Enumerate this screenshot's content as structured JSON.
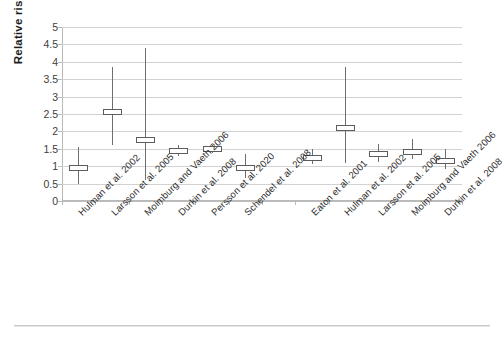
{
  "chart_data": {
    "type": "scatter",
    "title": "",
    "xlabel": "",
    "ylabel": "Relative risk",
    "ylim": [
      0,
      5
    ],
    "ytick_labels": [
      "5",
      "4.5",
      "4",
      "3.5",
      "3",
      "2.5",
      "2",
      "1.5",
      "1",
      "0.5",
      "0"
    ],
    "ytick_values": [
      5,
      4.5,
      4,
      3.5,
      3,
      2.5,
      2,
      1.5,
      1,
      0.5,
      0
    ],
    "grid": true,
    "legend": "none",
    "categories": [
      "Hulman et al. 2002",
      "Larsson et al. 2005",
      "Moimburg and Vaeth 2006",
      "Durkin et al. 2008",
      "Persson et al. 2020",
      "Schendel et al. 2008",
      "",
      "Eaton et al. 2001",
      "Hulman et al. 2002",
      "Larsson et al. 2005",
      "Moimburg and Vaeth 2006",
      "Durkin et al. 2008"
    ],
    "series": [
      {
        "name": "Relative risk (estimate with 95% CI)",
        "points": [
          {
            "label": "Hulman et al. 2002",
            "estimate": 0.95,
            "low": 0.5,
            "high": 1.55
          },
          {
            "label": "Larsson et al. 2005",
            "estimate": 2.55,
            "low": 1.6,
            "high": 3.85
          },
          {
            "label": "Moimburg and Vaeth 2006",
            "estimate": 1.75,
            "low": 0.6,
            "high": 4.4
          },
          {
            "label": "Durkin et al. 2008",
            "estimate": 1.45,
            "low": 1.3,
            "high": 1.62
          },
          {
            "label": "Persson et al. 2020",
            "estimate": 1.5,
            "low": 1.38,
            "high": 1.62
          },
          {
            "label": "Schendel et al. 2008",
            "estimate": 0.95,
            "low": 0.65,
            "high": 1.35
          },
          {
            "label": "",
            "estimate": null,
            "low": null,
            "high": null
          },
          {
            "label": "Eaton et al. 2001",
            "estimate": 1.25,
            "low": 1.05,
            "high": 1.5
          },
          {
            "label": "Hulman et al. 2002",
            "estimate": 2.1,
            "low": 1.1,
            "high": 3.85
          },
          {
            "label": "Larsson et al. 2005",
            "estimate": 1.35,
            "low": 1.12,
            "high": 1.65
          },
          {
            "label": "Moimburg and Vaeth 2006",
            "estimate": 1.42,
            "low": 1.2,
            "high": 1.78
          },
          {
            "label": "Durkin et al. 2008",
            "estimate": 1.15,
            "low": 0.92,
            "high": 1.5
          }
        ]
      }
    ],
    "colors": {
      "marker_edge": "#5c5c5c",
      "marker_fill": "#ffffff",
      "whisker": "#6e6e6e",
      "gridline": "#d2d2d2",
      "axis": "#b9b9b9",
      "text": "#2e2e2e"
    }
  }
}
